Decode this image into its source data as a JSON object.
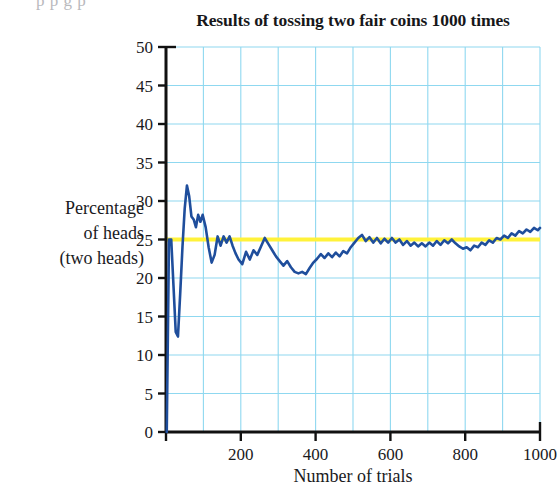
{
  "figure": {
    "top_cut_text": "p         p             g   p             ",
    "title": "Results of tossing two fair coins 1000 times",
    "ylabel_lines": [
      "Percentage",
      "of heads",
      "(two heads)"
    ],
    "xlabel": "Number of trials"
  },
  "colors": {
    "series_line": "#1F4E9C",
    "reference_line": "#FFF23A",
    "gridline": "#8FD8F0",
    "axis": "#111111",
    "text": "#1a1a1d",
    "background": "#ffffff"
  },
  "chart_data": {
    "type": "line",
    "title": "Results of tossing two fair coins 1000 times",
    "xlabel": "Number of trials",
    "ylabel": "Percentage of heads (two heads)",
    "xlim": [
      0,
      1000
    ],
    "ylim": [
      0,
      50
    ],
    "xticks": [
      0,
      200,
      400,
      600,
      800,
      1000
    ],
    "xtick_labels": [
      "",
      "200",
      "400",
      "600",
      "800",
      "1000"
    ],
    "yticks": [
      0,
      5,
      10,
      15,
      20,
      25,
      30,
      35,
      40,
      45,
      50
    ],
    "ytick_labels": [
      "0",
      "5",
      "10",
      "15",
      "20",
      "25",
      "30",
      "35",
      "40",
      "45",
      "50"
    ],
    "x_minor_step": 100,
    "y_minor_step": 5,
    "grid": true,
    "legend": false,
    "annotations": [
      {
        "name": "theoretical-probability-line",
        "type": "hline",
        "y": 25,
        "color": "#FFF23A",
        "label": "25% theoretical probability of two heads"
      }
    ],
    "series": [
      {
        "name": "Cumulative percentage of two heads",
        "color": "#1F4E9C",
        "x": [
          2,
          8,
          14,
          20,
          26,
          32,
          38,
          44,
          50,
          56,
          62,
          68,
          74,
          80,
          86,
          92,
          98,
          106,
          114,
          122,
          130,
          138,
          146,
          154,
          162,
          170,
          178,
          186,
          194,
          204,
          214,
          224,
          234,
          244,
          254,
          264,
          274,
          284,
          294,
          304,
          314,
          324,
          334,
          344,
          354,
          364,
          374,
          384,
          394,
          404,
          414,
          424,
          434,
          444,
          454,
          464,
          474,
          484,
          494,
          504,
          514,
          524,
          534,
          544,
          554,
          564,
          574,
          584,
          594,
          604,
          614,
          624,
          634,
          644,
          654,
          664,
          674,
          684,
          694,
          704,
          714,
          724,
          734,
          744,
          754,
          764,
          774,
          784,
          794,
          804,
          814,
          824,
          834,
          844,
          854,
          864,
          874,
          884,
          894,
          904,
          914,
          924,
          934,
          944,
          954,
          964,
          974,
          984,
          994,
          1000
        ],
        "y": [
          0,
          25.0,
          25.0,
          19.0,
          13.0,
          12.4,
          18.0,
          24.0,
          29.0,
          32.0,
          30.6,
          28.0,
          27.6,
          26.6,
          28.2,
          27.3,
          28.2,
          26.6,
          24.0,
          22.0,
          23.0,
          25.4,
          24.2,
          25.4,
          24.6,
          25.4,
          24.2,
          23.2,
          22.4,
          21.8,
          23.4,
          22.4,
          23.6,
          23.0,
          24.1,
          25.2,
          24.4,
          23.6,
          22.8,
          22.2,
          21.6,
          22.2,
          21.4,
          20.8,
          20.6,
          20.8,
          20.5,
          21.3,
          22.0,
          22.5,
          23.1,
          22.6,
          23.2,
          22.7,
          23.3,
          22.8,
          23.5,
          23.2,
          24.0,
          24.6,
          25.2,
          25.6,
          24.8,
          25.3,
          24.6,
          25.2,
          24.5,
          25.1,
          24.6,
          25.2,
          24.6,
          25.0,
          24.3,
          24.8,
          24.2,
          24.6,
          24.1,
          24.5,
          24.1,
          24.6,
          24.2,
          24.8,
          24.3,
          24.9,
          24.5,
          25.0,
          24.5,
          24.1,
          23.8,
          24.0,
          23.6,
          24.2,
          24.0,
          24.6,
          24.3,
          24.9,
          24.6,
          25.2,
          25.0,
          25.5,
          25.2,
          25.8,
          25.5,
          26.1,
          25.8,
          26.3,
          26.0,
          26.5,
          26.2,
          26.5
        ]
      }
    ]
  }
}
